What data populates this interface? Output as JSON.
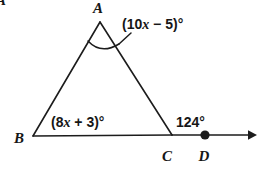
{
  "figure": {
    "type": "geometry-diagram",
    "corner_fragment": "A",
    "stroke_color": "#1c1c1c",
    "text_color": "#161616",
    "background_color": "#ffffff",
    "vertices": [
      {
        "name": "A",
        "label": "A",
        "x": 100,
        "y": 22,
        "label_x": 98,
        "label_y": 13
      },
      {
        "name": "B",
        "label": "B",
        "x": 33,
        "y": 136,
        "label_x": 14,
        "label_y": 143
      },
      {
        "name": "C",
        "label": "C",
        "x": 172,
        "y": 135,
        "label_x": 167,
        "label_y": 160
      },
      {
        "name": "D",
        "label": "D",
        "x": 205,
        "y": 135,
        "label_x": 200,
        "label_y": 160
      }
    ],
    "segments": [
      {
        "name": "side-ab",
        "from": "A",
        "to": "B"
      },
      {
        "name": "side-ac",
        "from": "A",
        "to": "C"
      },
      {
        "name": "base-bc",
        "from": "B",
        "to": "C"
      }
    ],
    "ray": {
      "name": "ray-cd",
      "from": "C",
      "through": "D",
      "tip_x": 255,
      "has_arrowhead": true,
      "has_point_marker_at_d": true
    },
    "angles": [
      {
        "name": "angle-a",
        "at_vertex": "A",
        "expression": "(10x − 5)°",
        "parts": {
          "open": "(10",
          "variable": "x",
          "operator": " − 5)",
          "degree": "°"
        },
        "label_x": 122,
        "label_y": 29,
        "has_arc": true,
        "has_leader": true
      },
      {
        "name": "angle-b",
        "at_vertex": "B",
        "expression": "(8x + 3)°",
        "parts": {
          "open": "(8",
          "variable": "x",
          "operator": " + 3)",
          "degree": "°"
        },
        "label_x": 51,
        "label_y": 127,
        "has_arc": false,
        "has_leader": false
      },
      {
        "name": "angle-exterior-c",
        "at_vertex": "C",
        "expression": "124°",
        "parts": {
          "open": "124",
          "variable": "",
          "operator": "",
          "degree": "°"
        },
        "label_x": 176,
        "label_y": 127,
        "has_arc": false,
        "has_leader": false
      }
    ]
  }
}
